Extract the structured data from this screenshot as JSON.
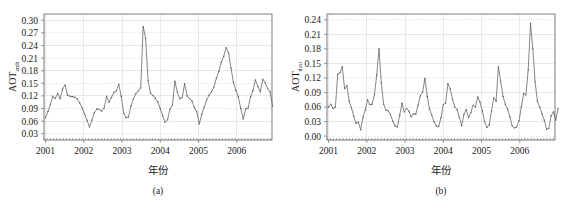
{
  "figure": {
    "background_color": "#ffffff",
    "line_color": "#5d5d5d",
    "grid_color": "#d4d4d4",
    "axis_color": "#6e6e6e"
  },
  "chart_data": [
    {
      "type": "line",
      "panel_id": "a",
      "caption": "(a)",
      "title": "",
      "xlabel": "年份",
      "ylabel": "AOT",
      "ylabel_subscript": "anth",
      "ylim": [
        0.015,
        0.315
      ],
      "xlim": [
        2000.96,
        2006.92
      ],
      "yticks": [
        0.03,
        0.06,
        0.09,
        0.12,
        0.15,
        0.18,
        0.21,
        0.24,
        0.27,
        0.3
      ],
      "ytick_labels": [
        "0.03",
        "0.06",
        "0.09",
        "0.12",
        "0.15",
        "0.18",
        "0.21",
        "0.24",
        "0.27",
        "0.30"
      ],
      "xticks": [
        2001,
        2002,
        2003,
        2004,
        2005,
        2006
      ],
      "xtick_labels": [
        "2001",
        "2002",
        "2003",
        "2004",
        "2005",
        "2006"
      ],
      "grid": true,
      "legend": "none",
      "marker": "dot",
      "x": [
        2001.0,
        2001.083,
        2001.167,
        2001.25,
        2001.333,
        2001.417,
        2001.5,
        2001.583,
        2001.667,
        2001.75,
        2001.833,
        2001.917,
        2002.0,
        2002.083,
        2002.167,
        2002.25,
        2002.333,
        2002.417,
        2002.5,
        2002.583,
        2002.667,
        2002.75,
        2002.833,
        2002.917,
        2003.0,
        2003.083,
        2003.167,
        2003.25,
        2003.333,
        2003.417,
        2003.5,
        2003.583,
        2003.667,
        2003.75,
        2003.833,
        2003.917,
        2004.0,
        2004.083,
        2004.167,
        2004.25,
        2004.333,
        2004.417,
        2004.5,
        2004.583,
        2004.667,
        2004.75,
        2004.833,
        2004.917,
        2005.0,
        2005.083,
        2005.167,
        2005.25,
        2005.333,
        2005.417,
        2005.5,
        2005.583,
        2005.667,
        2005.75,
        2005.833,
        2005.917,
        2006.0,
        2006.083,
        2006.167,
        2006.25,
        2006.333,
        2006.417,
        2006.5,
        2006.583,
        2006.667,
        2006.75,
        2006.833
      ],
      "values": [
        0.068,
        0.083,
        0.1,
        0.119,
        0.114,
        0.126,
        0.113,
        0.137,
        0.146,
        0.122,
        0.119,
        0.118,
        0.117,
        0.113,
        0.103,
        0.092,
        0.077,
        0.062,
        0.046,
        0.062,
        0.08,
        0.089,
        0.088,
        0.084,
        0.091,
        0.119,
        0.105,
        0.116,
        0.128,
        0.132,
        0.148,
        0.119,
        0.079,
        0.068,
        0.07,
        0.096,
        0.113,
        0.125,
        0.132,
        0.139,
        0.285,
        0.258,
        0.157,
        0.126,
        0.121,
        0.114,
        0.106,
        0.09,
        0.073,
        0.057,
        0.063,
        0.089,
        0.098,
        0.155,
        0.129,
        0.113,
        0.116,
        0.149,
        0.12,
        0.113,
        0.108,
        0.092,
        0.082,
        0.053,
        0.076,
        0.093,
        0.11,
        0.122,
        0.13,
        0.141,
        0.162
      ],
      "extra_values_note": "continues",
      "values_tail_x": [
        2005.0,
        2005.083,
        2005.167,
        2005.25,
        2005.333,
        2005.417,
        2005.5,
        2005.583,
        2005.667,
        2005.75,
        2005.833,
        2005.917,
        2006.0,
        2006.083,
        2006.167,
        2006.25,
        2006.333,
        2006.417,
        2006.5,
        2006.583,
        2006.667,
        2006.75,
        2006.833
      ],
      "values_tail": [
        0.053,
        0.076,
        0.093,
        0.11,
        0.122,
        0.13,
        0.141,
        0.162,
        0.178,
        0.2,
        0.214,
        0.235,
        0.222,
        0.186,
        0.152,
        0.133,
        0.118,
        0.09,
        0.065,
        0.089,
        0.091,
        0.118,
        0.133
      ],
      "series_full": [
        {
          "x": 2001.0,
          "y": 0.068
        },
        {
          "x": 2001.083,
          "y": 0.083
        },
        {
          "x": 2001.167,
          "y": 0.1
        },
        {
          "x": 2001.25,
          "y": 0.119
        },
        {
          "x": 2001.333,
          "y": 0.114
        },
        {
          "x": 2001.417,
          "y": 0.126
        },
        {
          "x": 2001.5,
          "y": 0.113
        },
        {
          "x": 2001.583,
          "y": 0.137
        },
        {
          "x": 2001.667,
          "y": 0.146
        },
        {
          "x": 2001.75,
          "y": 0.122
        },
        {
          "x": 2001.833,
          "y": 0.119
        },
        {
          "x": 2001.917,
          "y": 0.118
        },
        {
          "x": 2002.0,
          "y": 0.117
        },
        {
          "x": 2002.083,
          "y": 0.113
        },
        {
          "x": 2002.167,
          "y": 0.103
        },
        {
          "x": 2002.25,
          "y": 0.092
        },
        {
          "x": 2002.333,
          "y": 0.077
        },
        {
          "x": 2002.417,
          "y": 0.062
        },
        {
          "x": 2002.5,
          "y": 0.046
        },
        {
          "x": 2002.583,
          "y": 0.062
        },
        {
          "x": 2002.667,
          "y": 0.08
        },
        {
          "x": 2002.75,
          "y": 0.089
        },
        {
          "x": 2002.833,
          "y": 0.088
        },
        {
          "x": 2002.917,
          "y": 0.084
        },
        {
          "x": 2003.0,
          "y": 0.091
        },
        {
          "x": 2003.083,
          "y": 0.119
        },
        {
          "x": 2003.167,
          "y": 0.105
        },
        {
          "x": 2003.25,
          "y": 0.116
        },
        {
          "x": 2003.333,
          "y": 0.128
        },
        {
          "x": 2003.417,
          "y": 0.132
        },
        {
          "x": 2003.5,
          "y": 0.148
        },
        {
          "x": 2003.583,
          "y": 0.119
        },
        {
          "x": 2003.667,
          "y": 0.079
        },
        {
          "x": 2003.75,
          "y": 0.068
        },
        {
          "x": 2003.833,
          "y": 0.07
        },
        {
          "x": 2003.917,
          "y": 0.096
        },
        {
          "x": 2004.0,
          "y": 0.113
        },
        {
          "x": 2004.083,
          "y": 0.125
        },
        {
          "x": 2004.167,
          "y": 0.132
        },
        {
          "x": 2004.25,
          "y": 0.139
        },
        {
          "x": 2004.333,
          "y": 0.285
        },
        {
          "x": 2004.417,
          "y": 0.258
        },
        {
          "x": 2004.5,
          "y": 0.157
        },
        {
          "x": 2004.583,
          "y": 0.126
        },
        {
          "x": 2004.667,
          "y": 0.121
        },
        {
          "x": 2004.75,
          "y": 0.114
        },
        {
          "x": 2004.833,
          "y": 0.106
        },
        {
          "x": 2004.917,
          "y": 0.09
        },
        {
          "x": 2005.0,
          "y": 0.073
        },
        {
          "x": 2005.083,
          "y": 0.057
        },
        {
          "x": 2005.167,
          "y": 0.063
        },
        {
          "x": 2005.25,
          "y": 0.089
        },
        {
          "x": 2005.333,
          "y": 0.098
        },
        {
          "x": 2005.417,
          "y": 0.155
        },
        {
          "x": 2005.5,
          "y": 0.129
        },
        {
          "x": 2005.583,
          "y": 0.113
        },
        {
          "x": 2005.667,
          "y": 0.116
        },
        {
          "x": 2005.75,
          "y": 0.149
        },
        {
          "x": 2005.833,
          "y": 0.12
        },
        {
          "x": 2005.917,
          "y": 0.113
        },
        {
          "x": 2006.0,
          "y": 0.108
        },
        {
          "x": 2006.083,
          "y": 0.092
        },
        {
          "x": 2006.167,
          "y": 0.082
        },
        {
          "x": 2006.25,
          "y": 0.053
        },
        {
          "x": 2006.333,
          "y": 0.076
        },
        {
          "x": 2006.417,
          "y": 0.093
        }
      ]
    },
    {
      "type": "line",
      "panel_id": "b",
      "caption": "(b)",
      "title": "",
      "xlabel": "年份",
      "ylabel": "AOT",
      "ylabel_subscript": "dust",
      "ylim": [
        -0.008,
        0.252
      ],
      "xlim": [
        2000.96,
        2006.92
      ],
      "yticks": [
        0.0,
        0.03,
        0.06,
        0.09,
        0.12,
        0.15,
        0.18,
        0.21,
        0.24
      ],
      "ytick_labels": [
        "0.00",
        "0.03",
        "0.06",
        "0.09",
        "0.12",
        "0.15",
        "0.18",
        "0.21",
        "0.24"
      ],
      "xticks": [
        2001,
        2002,
        2003,
        2004,
        2005,
        2006
      ],
      "xtick_labels": [
        "2001",
        "2002",
        "2003",
        "2004",
        "2005",
        "2006"
      ],
      "grid": true,
      "legend": "none",
      "marker": "dot",
      "series_full": [
        {
          "x": 2001.0,
          "y": 0.06
        },
        {
          "x": 2001.083,
          "y": 0.066
        },
        {
          "x": 2001.167,
          "y": 0.057
        },
        {
          "x": 2001.25,
          "y": 0.06
        },
        {
          "x": 2001.333,
          "y": 0.128
        },
        {
          "x": 2001.417,
          "y": 0.131
        },
        {
          "x": 2001.5,
          "y": 0.143
        },
        {
          "x": 2001.583,
          "y": 0.098
        },
        {
          "x": 2001.667,
          "y": 0.104
        },
        {
          "x": 2001.75,
          "y": 0.072
        },
        {
          "x": 2001.833,
          "y": 0.058
        },
        {
          "x": 2001.917,
          "y": 0.041
        },
        {
          "x": 2002.0,
          "y": 0.026
        },
        {
          "x": 2002.083,
          "y": 0.029
        },
        {
          "x": 2002.167,
          "y": 0.013
        },
        {
          "x": 2002.25,
          "y": 0.039
        },
        {
          "x": 2002.333,
          "y": 0.054
        },
        {
          "x": 2002.417,
          "y": 0.075
        },
        {
          "x": 2002.5,
          "y": 0.065
        },
        {
          "x": 2002.583,
          "y": 0.066
        },
        {
          "x": 2002.667,
          "y": 0.086
        },
        {
          "x": 2002.75,
          "y": 0.126
        },
        {
          "x": 2002.833,
          "y": 0.18
        },
        {
          "x": 2002.917,
          "y": 0.11
        },
        {
          "x": 2003.0,
          "y": 0.066
        },
        {
          "x": 2003.083,
          "y": 0.054
        },
        {
          "x": 2003.167,
          "y": 0.052
        },
        {
          "x": 2003.25,
          "y": 0.044
        },
        {
          "x": 2003.333,
          "y": 0.031
        },
        {
          "x": 2003.417,
          "y": 0.021
        },
        {
          "x": 2003.5,
          "y": 0.019
        },
        {
          "x": 2003.583,
          "y": 0.043
        },
        {
          "x": 2003.667,
          "y": 0.068
        },
        {
          "x": 2003.75,
          "y": 0.05
        },
        {
          "x": 2003.833,
          "y": 0.057
        },
        {
          "x": 2003.917,
          "y": 0.052
        },
        {
          "x": 2004.0,
          "y": 0.04
        },
        {
          "x": 2004.083,
          "y": 0.046
        },
        {
          "x": 2004.167,
          "y": 0.045
        },
        {
          "x": 2004.25,
          "y": 0.064
        },
        {
          "x": 2004.333,
          "y": 0.083
        },
        {
          "x": 2004.417,
          "y": 0.091
        },
        {
          "x": 2004.5,
          "y": 0.119
        },
        {
          "x": 2004.583,
          "y": 0.082
        },
        {
          "x": 2004.667,
          "y": 0.056
        },
        {
          "x": 2004.75,
          "y": 0.043
        },
        {
          "x": 2004.833,
          "y": 0.029
        },
        {
          "x": 2004.917,
          "y": 0.021
        },
        {
          "x": 2005.0,
          "y": 0.02
        },
        {
          "x": 2005.083,
          "y": 0.038
        },
        {
          "x": 2005.167,
          "y": 0.065
        },
        {
          "x": 2005.25,
          "y": 0.068
        },
        {
          "x": 2005.333,
          "y": 0.108
        },
        {
          "x": 2005.417,
          "y": 0.098
        },
        {
          "x": 2005.5,
          "y": 0.076
        },
        {
          "x": 2005.583,
          "y": 0.06
        },
        {
          "x": 2005.667,
          "y": 0.055
        },
        {
          "x": 2005.75,
          "y": 0.039
        },
        {
          "x": 2005.833,
          "y": 0.021
        },
        {
          "x": 2005.917,
          "y": 0.045
        },
        {
          "x": 2006.0,
          "y": 0.055
        },
        {
          "x": 2006.083,
          "y": 0.038
        },
        {
          "x": 2006.167,
          "y": 0.049
        },
        {
          "x": 2006.25,
          "y": 0.064
        },
        {
          "x": 2006.333,
          "y": 0.06
        },
        {
          "x": 2006.417,
          "y": 0.081
        }
      ]
    }
  ],
  "panels": {
    "a": {
      "series": [
        0.068,
        0.083,
        0.1,
        0.119,
        0.114,
        0.126,
        0.113,
        0.137,
        0.146,
        0.122,
        0.119,
        0.118,
        0.117,
        0.113,
        0.103,
        0.092,
        0.077,
        0.062,
        0.046,
        0.062,
        0.08,
        0.089,
        0.088,
        0.084,
        0.091,
        0.119,
        0.105,
        0.116,
        0.128,
        0.132,
        0.148,
        0.119,
        0.079,
        0.068,
        0.07,
        0.096,
        0.113,
        0.125,
        0.132,
        0.139,
        0.285,
        0.258,
        0.157,
        0.126,
        0.121,
        0.114,
        0.106,
        0.09,
        0.073,
        0.057,
        0.063,
        0.089,
        0.098,
        0.155,
        0.129,
        0.113,
        0.116,
        0.149,
        0.12,
        0.113,
        0.108,
        0.092,
        0.082,
        0.053,
        0.076,
        0.093,
        0.11,
        0.122,
        0.13,
        0.141,
        0.162,
        0.178,
        0.2,
        0.214,
        0.235,
        0.222,
        0.186,
        0.152,
        0.133,
        0.118,
        0.09,
        0.065,
        0.089,
        0.091,
        0.118,
        0.133,
        0.158,
        0.142,
        0.13,
        0.16,
        0.151,
        0.138,
        0.13,
        0.096
      ],
      "x_start": 2001.0,
      "x_step": 0.0638
    },
    "b": {
      "series": [
        0.06,
        0.066,
        0.057,
        0.06,
        0.128,
        0.131,
        0.143,
        0.098,
        0.104,
        0.072,
        0.058,
        0.041,
        0.026,
        0.029,
        0.013,
        0.039,
        0.054,
        0.075,
        0.065,
        0.066,
        0.086,
        0.126,
        0.18,
        0.11,
        0.066,
        0.054,
        0.052,
        0.044,
        0.031,
        0.021,
        0.019,
        0.043,
        0.068,
        0.05,
        0.057,
        0.052,
        0.04,
        0.046,
        0.045,
        0.064,
        0.083,
        0.091,
        0.119,
        0.082,
        0.056,
        0.043,
        0.029,
        0.021,
        0.02,
        0.038,
        0.065,
        0.068,
        0.108,
        0.098,
        0.076,
        0.06,
        0.055,
        0.039,
        0.021,
        0.045,
        0.055,
        0.038,
        0.049,
        0.064,
        0.06,
        0.081,
        0.07,
        0.052,
        0.03,
        0.018,
        0.023,
        0.052,
        0.079,
        0.072,
        0.143,
        0.113,
        0.082,
        0.066,
        0.056,
        0.04,
        0.021,
        0.017,
        0.019,
        0.032,
        0.06,
        0.088,
        0.085,
        0.137,
        0.233,
        0.18,
        0.112,
        0.072,
        0.06,
        0.046,
        0.033,
        0.014,
        0.016,
        0.042,
        0.05,
        0.033,
        0.057
      ],
      "x_start": 2001.0,
      "x_step": 0.06
    }
  }
}
